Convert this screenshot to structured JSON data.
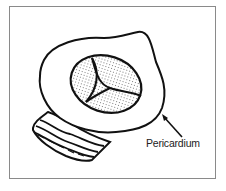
{
  "figure": {
    "type": "illustration",
    "labels": [
      {
        "text": "Pericardium",
        "target": "outer-rim"
      }
    ],
    "colors": {
      "line": "#111111",
      "fill": "#ffffff",
      "frame": "#8a8a8a",
      "stipple": "#555555"
    }
  }
}
